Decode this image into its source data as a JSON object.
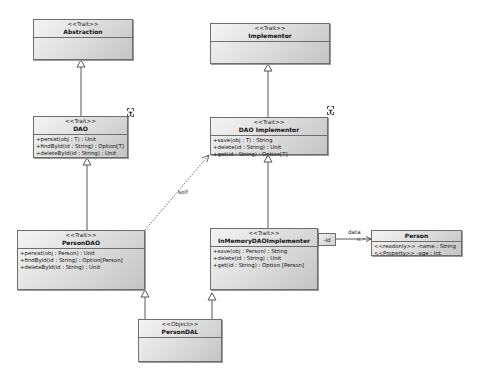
{
  "diagram": {
    "type": "UML class diagram",
    "classes": {
      "abstraction": {
        "stereotype": "<<Trait>>",
        "name": "Abstraction",
        "operations": []
      },
      "dao": {
        "stereotype": "<<Trait>>",
        "name": "DAO",
        "template_param": "T",
        "operations": [
          "+persist(obj : T) : Unit",
          "+findById(id : String) : Option[T]",
          "+deleteById(id : String) : Unit"
        ]
      },
      "implementor": {
        "stereotype": "<<Trait>>",
        "name": "Implementor",
        "operations": []
      },
      "dao_implementor": {
        "stereotype": "<<Trait>>",
        "name": "DAO Implementor",
        "template_param": "T",
        "operations": [
          "+save(obj : T) : String",
          "+delete(id : String) : Unit",
          "+get(id : String) : Option[T]"
        ]
      },
      "person_dao": {
        "stereotype": "<<Trait>>",
        "name": "PersonDAO",
        "operations": [
          "+persist(obj : Person) : Unit",
          "+findById(id : String) : Option[Person]",
          "+deleteById(id : String) : Unit"
        ]
      },
      "inmemory": {
        "stereotype": "<<Trait>>",
        "name": "InMemoryDAOImplementer",
        "operations": [
          "+save(obj : Person) : String",
          "+delete(id : String) : Unit",
          "+get(id : String) : Option [Person]"
        ]
      },
      "person": {
        "name": "Person",
        "attributes": [
          "<<readonly>> -name : String",
          "<<Property>> -age : Int"
        ]
      },
      "person_dal": {
        "stereotype": "<<Object>>",
        "name": "PersonDAL",
        "operations": []
      }
    },
    "relations": {
      "self_label": "self",
      "data_label": "data",
      "data_multiplicity": "0..*",
      "qualifier": "-id"
    }
  }
}
